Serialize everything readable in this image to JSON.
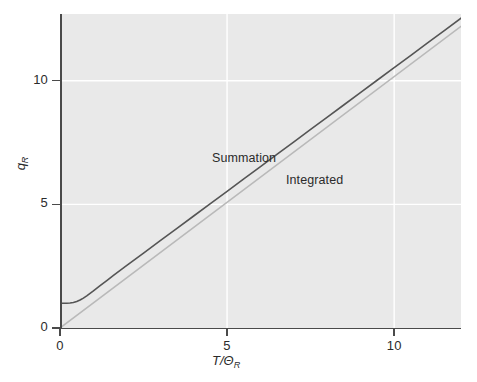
{
  "figure": {
    "background": "#ffffff",
    "panel_background": "#e9e9e9",
    "grid_color": "#ffffff",
    "axis_color": "#4a4a4a"
  },
  "axes": {
    "y_title_main": "q",
    "y_title_sub": "R",
    "x_title_main": "T/Θ",
    "x_title_sub": "R",
    "y_ticks": [
      {
        "value": 0,
        "label": "0"
      },
      {
        "value": 5,
        "label": "5"
      },
      {
        "value": 10,
        "label": "10"
      }
    ],
    "x_ticks": [
      {
        "value": 0,
        "label": "0"
      },
      {
        "value": 5,
        "label": "5"
      },
      {
        "value": 10,
        "label": "10"
      }
    ]
  },
  "annotations": {
    "summation": "Summation",
    "integrated": "Integrated"
  },
  "chart_data": {
    "type": "line",
    "title": "",
    "xlabel": "T/Θ_R",
    "ylabel": "q_R",
    "xlim": [
      0,
      12.0
    ],
    "ylim": [
      0,
      12.7
    ],
    "grid": true,
    "grid_x": [
      5,
      10
    ],
    "grid_y": [
      5,
      10
    ],
    "legend": "inline-annotations",
    "series": [
      {
        "name": "Summation",
        "color": "#555555",
        "width": 1.6,
        "x": [
          0.0,
          0.1,
          0.2,
          0.3,
          0.4,
          0.5,
          0.6,
          0.7,
          0.8,
          0.9,
          1.0,
          1.2,
          1.4,
          1.6,
          1.8,
          2.0,
          2.5,
          3.0,
          3.5,
          4.0,
          4.5,
          5.0,
          5.5,
          6.0,
          6.5,
          7.0,
          7.5,
          8.0,
          8.5,
          9.0,
          9.5,
          10.0,
          10.5,
          11.0,
          11.5,
          12.0
        ],
        "y": [
          1.0,
          1.0,
          1.0,
          1.01,
          1.03,
          1.07,
          1.13,
          1.21,
          1.3,
          1.4,
          1.5,
          1.71,
          1.92,
          2.13,
          2.33,
          2.53,
          3.03,
          3.53,
          4.03,
          4.53,
          5.03,
          5.53,
          6.03,
          6.53,
          7.03,
          7.53,
          8.03,
          8.53,
          9.03,
          9.53,
          10.03,
          10.53,
          11.03,
          11.53,
          12.03,
          12.53
        ]
      },
      {
        "name": "Integrated",
        "color": "#b9b9b9",
        "width": 1.6,
        "x": [
          0.0,
          12.0
        ],
        "y": [
          0.0,
          12.2
        ]
      }
    ]
  }
}
